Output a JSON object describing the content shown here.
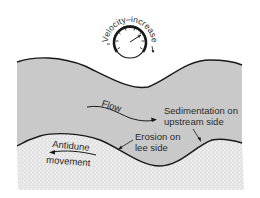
{
  "diagram": {
    "gauge": {
      "label": "Velocity–increase"
    },
    "flow_label": "Flow",
    "sedimentation_label": {
      "line1": "Sedimentation on",
      "line2": "upstream side"
    },
    "erosion_label": {
      "line1": "Erosion on",
      "line2": "lee side"
    },
    "antidune_label": {
      "line1": "Antidune",
      "line2": "movement"
    },
    "colors": {
      "water": "#c9c9c9",
      "sediment": "#e4e4e4",
      "line": "#1a1a1a",
      "text": "#2a2a2a"
    }
  }
}
